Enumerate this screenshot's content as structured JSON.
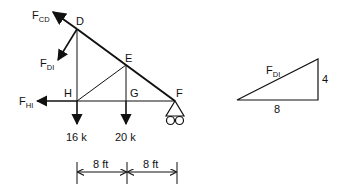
{
  "truss": {
    "nodes": {
      "D": "D",
      "E": "E",
      "F": "F",
      "G": "G",
      "H": "H"
    },
    "forces": {
      "F_CD": {
        "main": "F",
        "sub": "CD"
      },
      "F_DI": {
        "main": "F",
        "sub": "DI"
      },
      "F_HI": {
        "main": "F",
        "sub": "HI"
      }
    },
    "loads": {
      "H_load": "16 k",
      "G_load": "20 k"
    },
    "dimensions": {
      "left_span": "8 ft",
      "right_span": "8 ft"
    }
  },
  "slope_triangle": {
    "hypotenuse": {
      "main": "F",
      "sub": "DI"
    },
    "vertical": "4",
    "horizontal": "8"
  },
  "colors": {
    "line": "#111111",
    "background": "#ffffff"
  }
}
